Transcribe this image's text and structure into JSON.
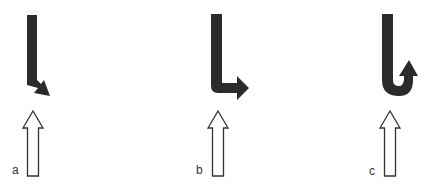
{
  "figure": {
    "panels": [
      {
        "id": "a",
        "label": "a",
        "turn_type": "slight-right",
        "description": "black arrow bending slightly down-right above an upward outline arrow"
      },
      {
        "id": "b",
        "label": "b",
        "turn_type": "right-turn",
        "description": "black L-shaped arrow turning right above an upward outline arrow"
      },
      {
        "id": "c",
        "label": "c",
        "turn_type": "u-turn",
        "description": "black J-shaped arrow curving back upward above an upward outline arrow"
      }
    ],
    "colors": {
      "filled_arrow": "#2b2b2b",
      "outline_arrow_stroke": "#333333",
      "outline_arrow_fill": "#ffffff",
      "background": "#ffffff"
    }
  }
}
